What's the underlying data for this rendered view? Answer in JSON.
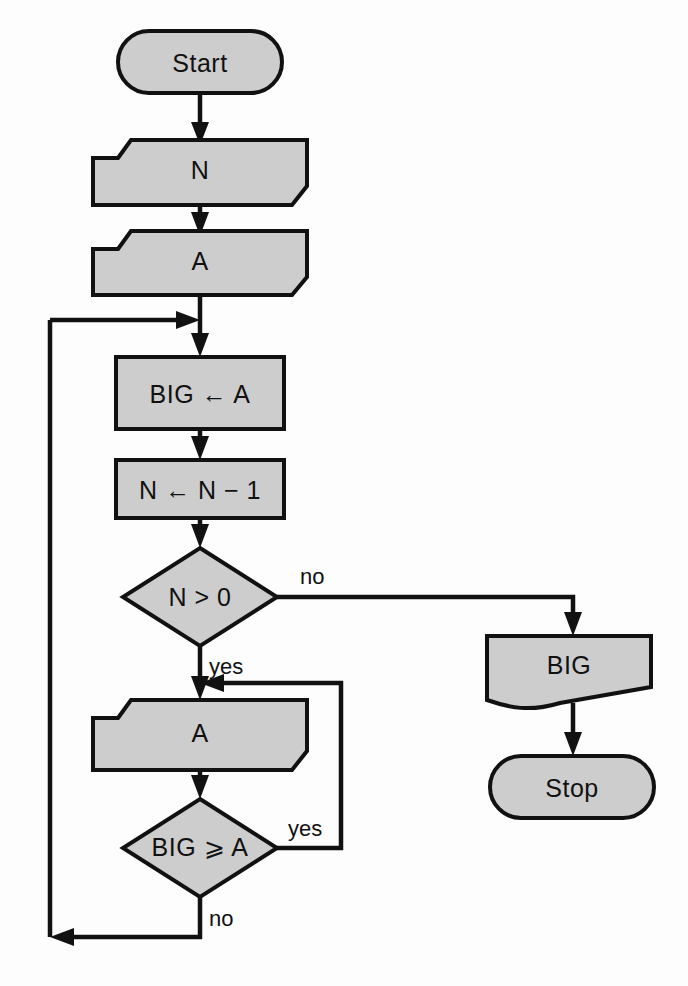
{
  "diagram": {
    "colors": {
      "node_fill": "#cdcdcd",
      "stroke": "#111111",
      "background": "#fdfdfd"
    },
    "nodes": {
      "start": {
        "label": "Start",
        "shape": "terminator"
      },
      "input_n": {
        "label": "N",
        "shape": "input"
      },
      "input_a_first": {
        "label": "A",
        "shape": "input"
      },
      "assign_big": {
        "label": "BIG ← A",
        "shape": "process"
      },
      "decrement_n": {
        "label": "N ← N − 1",
        "shape": "process"
      },
      "decision_n": {
        "label": "N > 0",
        "shape": "decision"
      },
      "input_a_loop": {
        "label": "A",
        "shape": "input"
      },
      "decision_big": {
        "label": "BIG ⩾ A",
        "shape": "decision"
      },
      "output_big": {
        "label": "BIG",
        "shape": "document"
      },
      "stop": {
        "label": "Stop",
        "shape": "terminator"
      }
    },
    "edge_labels": {
      "decision_n_no": "no",
      "decision_n_yes": "yes",
      "decision_big_yes": "yes",
      "decision_big_no": "no"
    }
  }
}
